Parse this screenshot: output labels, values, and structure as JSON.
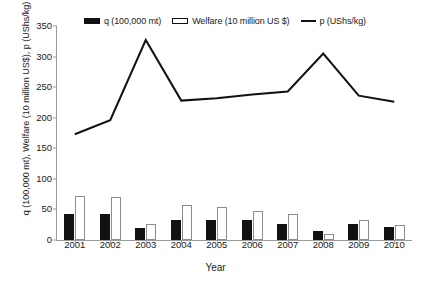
{
  "chart_data": {
    "type": "bar",
    "title": "",
    "xlabel": "Year",
    "ylabel": "q (100,000 mt), Welfare (10 million US$), p (UShs/kg)",
    "categories": [
      "2001",
      "2002",
      "2003",
      "2004",
      "2005",
      "2006",
      "2007",
      "2008",
      "2009",
      "2010"
    ],
    "ylim": [
      0,
      350
    ],
    "yticks": [
      0,
      50,
      100,
      150,
      200,
      250,
      300,
      350
    ],
    "grid": false,
    "legend_position": "top",
    "series": [
      {
        "name": "q (100,000 mt)",
        "type": "bar",
        "color": "#111111",
        "values": [
          43,
          42,
          20,
          32,
          32,
          33,
          27,
          14,
          26,
          21
        ]
      },
      {
        "name": "Welfare (10 million US $)",
        "type": "bar",
        "color": "#ffffff",
        "values": [
          72,
          71,
          27,
          58,
          54,
          47,
          42,
          10,
          32,
          25
        ]
      },
      {
        "name": "p (UShs/kg)",
        "type": "line",
        "color": "#111111",
        "values": [
          173,
          196,
          327,
          228,
          232,
          238,
          243,
          305,
          236,
          226
        ]
      }
    ]
  },
  "legend": {
    "items": [
      {
        "label": "q (100,000 mt)",
        "swatch": "filled-bar"
      },
      {
        "label": "Welfare (10 million US $)",
        "swatch": "hollow-bar"
      },
      {
        "label": "p (UShs/kg)",
        "swatch": "line"
      }
    ]
  },
  "axes": {
    "y_title": "q (100,000 mt), Welfare (10 million US$), p (UShs/kg)",
    "x_title": "Year"
  }
}
